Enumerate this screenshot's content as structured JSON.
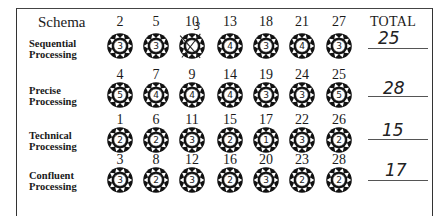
{
  "header": {
    "schema_label": "Schema",
    "total_label": "TOTAL"
  },
  "rows": [
    {
      "label_line1": "Sequential",
      "label_line2": "Processing",
      "items": [
        {
          "num": "2",
          "score": "3"
        },
        {
          "num": "5",
          "score": "3"
        },
        {
          "num": "10",
          "score": "",
          "crossed_out": true,
          "correction": "3"
        },
        {
          "num": "13",
          "score": "4"
        },
        {
          "num": "18",
          "score": "3"
        },
        {
          "num": "21",
          "score": "4"
        },
        {
          "num": "27",
          "score": "3"
        }
      ],
      "total": "25"
    },
    {
      "label_line1": "Precise",
      "label_line2": "Processing",
      "items": [
        {
          "num": "4",
          "score": "5"
        },
        {
          "num": "7",
          "score": "4"
        },
        {
          "num": "9",
          "score": "4"
        },
        {
          "num": "14",
          "score": "4"
        },
        {
          "num": "19",
          "score": "3"
        },
        {
          "num": "24",
          "score": "3"
        },
        {
          "num": "25",
          "score": "5"
        }
      ],
      "total": "28"
    },
    {
      "label_line1": "Technical",
      "label_line2": "Processing",
      "items": [
        {
          "num": "1",
          "score": "2"
        },
        {
          "num": "6",
          "score": "2"
        },
        {
          "num": "11",
          "score": "3"
        },
        {
          "num": "15",
          "score": "2"
        },
        {
          "num": "17",
          "score": "1"
        },
        {
          "num": "22",
          "score": "3"
        },
        {
          "num": "26",
          "score": "2"
        }
      ],
      "total": "15"
    },
    {
      "label_line1": "Confluent",
      "label_line2": "Processing",
      "items": [
        {
          "num": "3",
          "score": "3"
        },
        {
          "num": "8",
          "score": "2"
        },
        {
          "num": "12",
          "score": "3"
        },
        {
          "num": "16",
          "score": "2"
        },
        {
          "num": "20",
          "score": "3"
        },
        {
          "num": "23",
          "score": "2"
        },
        {
          "num": "28",
          "score": "2"
        }
      ],
      "total": "17"
    }
  ],
  "icons": {
    "badge": "sunburst-badge-icon"
  }
}
